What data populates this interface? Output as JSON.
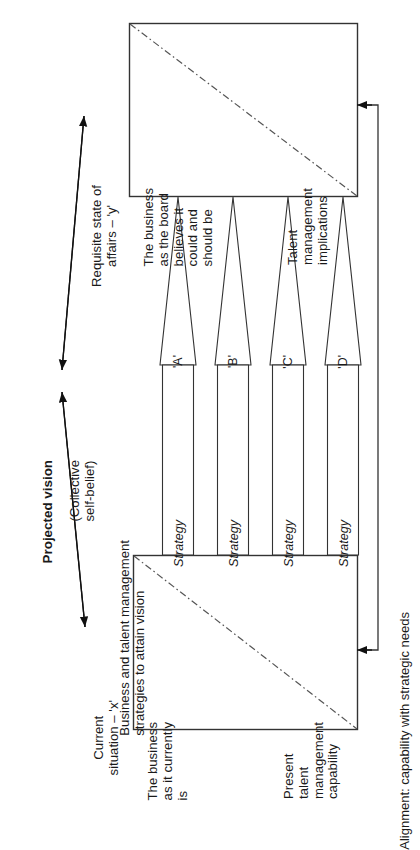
{
  "diagram": {
    "title_label": "Projected vision",
    "title_sub": "(Collective\nself-belief)",
    "top_box": {
      "primary_text": "The business\nas the board\nbelieves it\ncould and\nshould be",
      "secondary_text": "Talent\nmanagement\nimplications",
      "outer_label": "Requisite state of\naffairs – 'y'"
    },
    "bottom_box": {
      "primary_text": "The business\nas it currently\nis",
      "secondary_text": "Present\ntalent\nmanagement\ncapability",
      "outer_label": "Current\nsituation – 'x'"
    },
    "middle_label": "Business and talent management\nstrategies to attain vision",
    "alignment_label": "Alignment: capability with strategic needs",
    "strategies": [
      {
        "letter": "'A'",
        "label": "Strategy"
      },
      {
        "letter": "'B'",
        "label": "Strategy"
      },
      {
        "letter": "'C'",
        "label": "Strategy"
      },
      {
        "letter": "'D'",
        "label": "Strategy"
      }
    ],
    "colors": {
      "stroke": "#333333",
      "text": "#1a1a1a",
      "background": "#ffffff",
      "dashdot": "#555555"
    }
  }
}
